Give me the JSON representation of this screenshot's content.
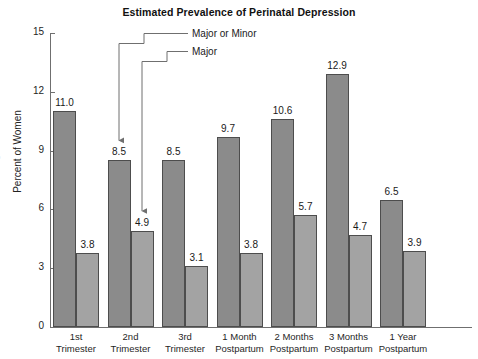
{
  "chart_data": {
    "type": "bar",
    "title": "Estimated Prevalence of Perinatal Depression",
    "xlabel": "",
    "ylabel": "Percent of Women",
    "ylim": [
      0,
      15
    ],
    "yticks": [
      0,
      3,
      6,
      9,
      12,
      15
    ],
    "ytick_labels": [
      "0",
      "3",
      "6",
      "9",
      "12",
      "15"
    ],
    "grid": false,
    "legend_position": "callout-annotations",
    "categories": [
      "1st Trimester",
      "2nd Trimester",
      "3rd Trimester",
      "1 Month Postpartum",
      "2 Months Postpartum",
      "3 Months Postpartum",
      "1 Year Postpartum"
    ],
    "category_lines": [
      [
        "1st",
        "Trimester"
      ],
      [
        "2nd",
        "Trimester"
      ],
      [
        "3rd",
        "Trimester"
      ],
      [
        "1 Month",
        "Postpartum"
      ],
      [
        "2 Months",
        "Postpartum"
      ],
      [
        "3 Months",
        "Postpartum"
      ],
      [
        "1 Year",
        "Postpartum"
      ]
    ],
    "series": [
      {
        "name": "Major or Minor",
        "color": "#8b8b8b",
        "values": [
          11.0,
          8.5,
          8.5,
          9.7,
          10.6,
          12.9,
          6.5
        ],
        "labels": [
          "11.0",
          "8.5",
          "8.5",
          "9.7",
          "10.6",
          "12.9",
          "6.5"
        ]
      },
      {
        "name": "Major",
        "color": "#a3a3a3",
        "values": [
          3.8,
          4.9,
          3.1,
          3.8,
          5.7,
          4.7,
          3.9
        ],
        "labels": [
          "3.8",
          "4.9",
          "3.1",
          "3.8",
          "5.7",
          "4.7",
          "3.9"
        ]
      }
    ],
    "annotations": [
      {
        "text": "Major or Minor",
        "points_to_category": "2nd Trimester",
        "points_to_series": "Major or Minor",
        "points_to_value": 8.5
      },
      {
        "text": "Major",
        "points_to_category": "2nd Trimester",
        "points_to_series": "Major",
        "points_to_value": 4.9
      }
    ],
    "artifact_text": "s"
  }
}
